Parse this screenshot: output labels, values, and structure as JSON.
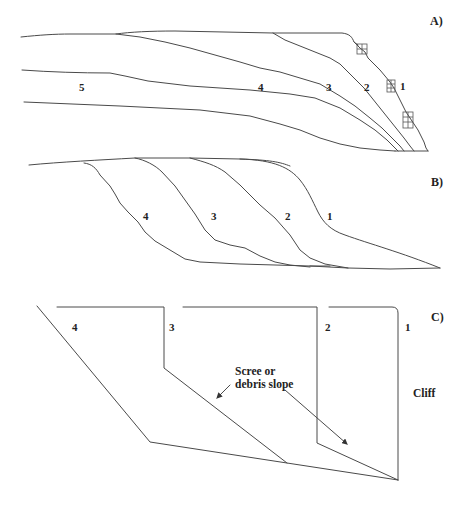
{
  "panels": {
    "A": {
      "label": "A)",
      "profile_labels": [
        "1",
        "2",
        "3",
        "4",
        "5"
      ]
    },
    "B": {
      "label": "B)",
      "profile_labels": [
        "1",
        "2",
        "3",
        "4"
      ]
    },
    "C": {
      "label": "C)",
      "profile_labels": [
        "1",
        "2",
        "3",
        "4"
      ],
      "annotation": "Scree or\ndebris slope",
      "cliff_label": "Cliff"
    }
  },
  "colors": {
    "line": "#4a4a4a",
    "text": "#222222",
    "background": "#ffffff"
  }
}
